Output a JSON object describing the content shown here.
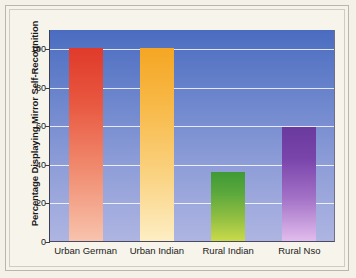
{
  "chart_data": {
    "type": "bar",
    "title": "",
    "subtitle": "",
    "xlabel": "",
    "ylabel": "Percentage Displaying Mirror Self-Recognition",
    "categories": [
      "Urban German",
      "Urban Indian",
      "Rural Indian",
      "Rural Nso"
    ],
    "values": [
      100,
      100,
      36,
      59
    ],
    "series": [
      {
        "name": "Percentage Displaying Mirror Self-Recognition",
        "values": [
          100,
          100,
          36,
          59
        ]
      }
    ],
    "bar_colors": [
      "#e03a2b",
      "#f5a623",
      "#3f9a35",
      "#6a3a9e"
    ],
    "bar_colors_bottom": [
      "#f8c3ad",
      "#fdeec4",
      "#c9da4a",
      "#e2bced"
    ],
    "ylim": [
      0,
      110
    ],
    "yticks": [
      0,
      20,
      40,
      60,
      80,
      100
    ],
    "ytick_labels": [
      "0",
      "20",
      "40",
      "60",
      "80",
      "100"
    ],
    "xlim_categories": 4,
    "grid": true,
    "grid_axis": "y",
    "grid_color": "#ffffff",
    "legend": false,
    "legend_position": "none",
    "plot_background_top": "#4a6cc0",
    "plot_background_bottom": "#aeb5e2",
    "figure_background": "#f4f1e8"
  },
  "axis": {
    "y_title": "Percentage Displaying Mirror Self-Recognition",
    "y_tick_labels": [
      "100",
      "80",
      "60",
      "40",
      "20",
      "0"
    ],
    "x_tick_labels": [
      "Urban German",
      "Urban Indian",
      "Rural Indian",
      "Rural Nso"
    ]
  }
}
